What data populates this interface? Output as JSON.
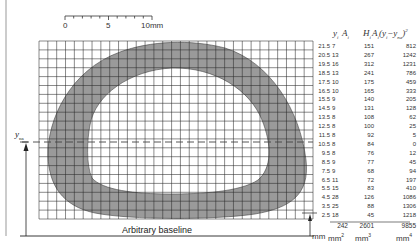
{
  "scale_bar": {
    "labels": [
      "0",
      "5",
      "10mm"
    ],
    "length_mm": 10
  },
  "baseline_label": "Arbitrary baseline",
  "neutral_axis_label": "y",
  "neutral_axis_sub": "na",
  "table": {
    "headers": {
      "y": "y",
      "y_sub": "i",
      "A": "A",
      "A_sub": "i",
      "H": "H",
      "H_sub": "i",
      "M": "A",
      "M_sub": "i",
      "M_expr_open": "(y",
      "M_expr_sub1": "i",
      "M_expr_mid": "−y",
      "M_expr_sub2": "na",
      "M_expr_close": ")",
      "M_sup": "2"
    },
    "rows": [
      {
        "y": "21.5",
        "A": "7",
        "H": "151",
        "M": "812"
      },
      {
        "y": "20.5",
        "A": "13",
        "H": "267",
        "M": "1242"
      },
      {
        "y": "19.5",
        "A": "16",
        "H": "312",
        "M": "1231"
      },
      {
        "y": "18.5",
        "A": "13",
        "H": "241",
        "M": "786"
      },
      {
        "y": "17.5",
        "A": "10",
        "H": "175",
        "M": "459"
      },
      {
        "y": "16.5",
        "A": "10",
        "H": "165",
        "M": "333"
      },
      {
        "y": "15.5",
        "A": "9",
        "H": "140",
        "M": "205"
      },
      {
        "y": "14.5",
        "A": "9",
        "H": "131",
        "M": "128"
      },
      {
        "y": "13.5",
        "A": "8",
        "H": "108",
        "M": "62"
      },
      {
        "y": "12.5",
        "A": "8",
        "H": "100",
        "M": "25"
      },
      {
        "y": "11.5",
        "A": "8",
        "H": "92",
        "M": "5"
      },
      {
        "y": "10.5",
        "A": "8",
        "H": "84",
        "M": "0"
      },
      {
        "y": "9.5",
        "A": "8",
        "H": "76",
        "M": "12"
      },
      {
        "y": "8.5",
        "A": "9",
        "H": "77",
        "M": "45"
      },
      {
        "y": "7.5",
        "A": "9",
        "H": "68",
        "M": "94"
      },
      {
        "y": "6.5",
        "A": "11",
        "H": "72",
        "M": "197"
      },
      {
        "y": "5.5",
        "A": "15",
        "H": "83",
        "M": "410"
      },
      {
        "y": "4.5",
        "A": "28",
        "H": "126",
        "M": "1086"
      },
      {
        "y": "3.5",
        "A": "25",
        "H": "88",
        "M": "1306"
      },
      {
        "y": "2.5",
        "A": "18",
        "H": "45",
        "M": "1218"
      }
    ],
    "totals": {
      "A": "242",
      "H": "2601",
      "M": "9855"
    },
    "units": {
      "y": "mm",
      "A": "mm",
      "A_sup": "2",
      "H": "mm",
      "H_sup": "3",
      "M": "mm",
      "M_sup": "4"
    }
  },
  "colors": {
    "shade": "#9a9a9a",
    "grid": "#2a2a2a",
    "text": "#333333"
  }
}
